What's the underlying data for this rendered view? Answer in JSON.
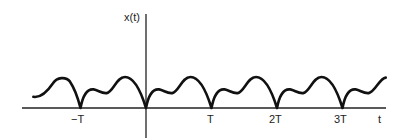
{
  "chart_data": {
    "type": "line",
    "title": "",
    "ylabel": "x(t)",
    "xlabel": "t",
    "tick_labels": [
      "−T",
      "T",
      "2T",
      "3T"
    ],
    "tick_positions_in_T": [
      -1,
      1,
      2,
      3
    ],
    "period": "T",
    "x_range_in_T": [
      -1.75,
      3.65
    ],
    "y_range": [
      0,
      1
    ],
    "series": [
      {
        "name": "x(t)",
        "x_in_T": [
          -1.7,
          -1.5,
          -1.25,
          -1.0,
          -0.85,
          -0.7,
          -0.55,
          -0.35,
          -0.15,
          0.0,
          0.15,
          0.3,
          0.45,
          0.65,
          0.85,
          1.0
        ],
        "values": [
          0.35,
          0.35,
          0.98,
          0.0,
          0.6,
          0.48,
          0.5,
          1.0,
          0.6,
          0.0,
          0.6,
          0.48,
          0.5,
          1.0,
          0.6,
          0.0
        ]
      }
    ],
    "grid": false,
    "legend": "none"
  },
  "labels": {
    "y_axis": "x(t)",
    "x_axis": "t",
    "ticks": [
      "−T",
      "T",
      "2T",
      "3T"
    ]
  }
}
